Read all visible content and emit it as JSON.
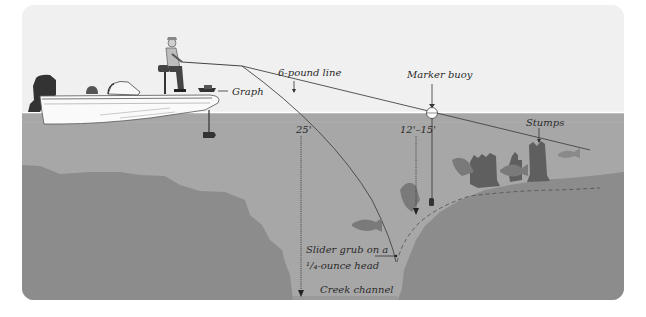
{
  "diagram": {
    "colors": {
      "sky": "#f0f0f0",
      "water": "#a7a7a7",
      "bottom": "#8c8c8c",
      "bottom_dark": "#858585",
      "fish": "#7a7a7a",
      "stump": "#5f5f5f",
      "line": "#444444",
      "text": "#2a2a2a"
    },
    "labels": {
      "line": "6-pound line",
      "graph": "Graph",
      "marker_buoy": "Marker buoy",
      "stumps": "Stumps",
      "depth_deep": "25'",
      "depth_shallow": "12'–15'",
      "lure_line1": "Slider grub on a",
      "lure_line2": "¹/₄-ounce head",
      "channel": "Creek channel"
    },
    "elements": [
      "bass boat with angler",
      "outboard motor",
      "trolling motor",
      "depth finder (graph)",
      "fishing line",
      "marker buoy",
      "submerged stumps",
      "fish",
      "creek channel drop-off"
    ]
  }
}
